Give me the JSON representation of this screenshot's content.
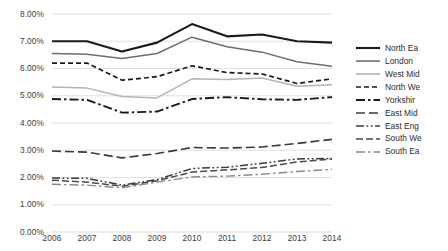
{
  "chart_data": {
    "type": "line",
    "title": "",
    "xlabel": "",
    "ylabel": "",
    "categories": [
      "2006",
      "2007",
      "2008",
      "2009",
      "2010",
      "2011",
      "2012",
      "2013",
      "2014"
    ],
    "x": [
      2006,
      2007,
      2008,
      2009,
      2010,
      2011,
      2012,
      2013,
      2014
    ],
    "ylim": [
      0.0,
      8.0
    ],
    "yticks": [
      0.0,
      1.0,
      2.0,
      3.0,
      4.0,
      5.0,
      6.0,
      7.0,
      8.0
    ],
    "ytick_labels": [
      "0.00%",
      "1.00%",
      "2.00%",
      "3.00%",
      "4.00%",
      "5.00%",
      "6.00%",
      "7.00%",
      "8.00%"
    ],
    "ytick_format": "percent",
    "grid": true,
    "grid_axis": "y",
    "legend_position": "right",
    "series": [
      {
        "name": "North Ea",
        "color": "#1a1a1a",
        "dash": "solid",
        "width": 2.1,
        "values": [
          7.0,
          7.0,
          6.62,
          6.95,
          7.63,
          7.18,
          7.25,
          7.0,
          6.95
        ]
      },
      {
        "name": "London",
        "color": "#6e6e6e",
        "dash": "solid",
        "width": 1.5,
        "values": [
          6.55,
          6.52,
          6.37,
          6.55,
          7.15,
          6.8,
          6.6,
          6.25,
          6.08
        ]
      },
      {
        "name": "West Mid",
        "color": "#b5b5b5",
        "dash": "solid",
        "width": 1.5,
        "values": [
          5.32,
          5.28,
          4.97,
          4.92,
          5.62,
          5.6,
          5.65,
          5.35,
          5.4
        ]
      },
      {
        "name": "North We",
        "color": "#1a1a1a",
        "dash": "dashed",
        "width": 1.7,
        "values": [
          6.2,
          6.2,
          5.57,
          5.7,
          6.1,
          5.85,
          5.8,
          5.45,
          5.62
        ]
      },
      {
        "name": "Yorkshir",
        "color": "#1a1a1a",
        "dash": "dashdot",
        "width": 1.9,
        "values": [
          4.88,
          4.85,
          4.38,
          4.42,
          4.88,
          4.95,
          4.87,
          4.85,
          4.95
        ]
      },
      {
        "name": "East Mid",
        "color": "#3a3a3a",
        "dash": "longdash",
        "width": 1.6,
        "values": [
          2.97,
          2.93,
          2.72,
          2.88,
          3.1,
          3.08,
          3.12,
          3.25,
          3.4
        ]
      },
      {
        "name": "East Eng",
        "color": "#3a3a3a",
        "dash": "dashdotdot",
        "width": 1.5,
        "values": [
          1.98,
          1.97,
          1.72,
          1.92,
          2.33,
          2.38,
          2.52,
          2.68,
          2.7
        ]
      },
      {
        "name": "South We",
        "color": "#4a4a4a",
        "dash": "meddash",
        "width": 1.5,
        "values": [
          1.9,
          1.83,
          1.68,
          1.88,
          2.2,
          2.28,
          2.37,
          2.57,
          2.68
        ]
      },
      {
        "name": "South Ea",
        "color": "#8a8a8a",
        "dash": "dashdot",
        "width": 1.4,
        "values": [
          1.75,
          1.72,
          1.62,
          1.83,
          2.02,
          2.05,
          2.12,
          2.22,
          2.3
        ]
      }
    ]
  }
}
